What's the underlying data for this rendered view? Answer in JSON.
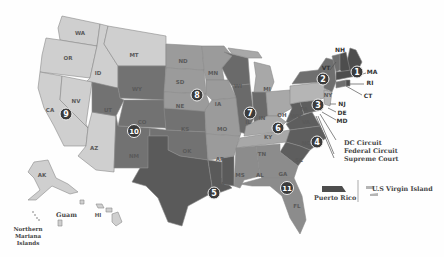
{
  "map": {
    "title": "U.S. Federal Judicial Circuits",
    "colors": {
      "circuit_1": "#4d4d4d",
      "circuit_2": "#6f6f6f",
      "circuit_3": "#b5b5b5",
      "circuit_4": "#5e5e5e",
      "circuit_5": "#5a5a5a",
      "circuit_6": "#a8a8a8",
      "circuit_7": "#6a6a6a",
      "circuit_8": "#9b9b9b",
      "circuit_9": "#cfcfcf",
      "circuit_10": "#727272",
      "circuit_11": "#8c8c8c",
      "badge": "#3b3b3b"
    },
    "circuits": [
      {
        "number": "1",
        "states": [
          "ME",
          "NH",
          "MA",
          "RI",
          "Puerto Rico"
        ]
      },
      {
        "number": "2",
        "states": [
          "VT",
          "NY",
          "CT"
        ]
      },
      {
        "number": "3",
        "states": [
          "PA",
          "NJ",
          "DE",
          "U.S Virgin Island"
        ]
      },
      {
        "number": "4",
        "states": [
          "MD",
          "VA",
          "WV",
          "NC",
          "SC"
        ]
      },
      {
        "number": "5",
        "states": [
          "TX",
          "LA",
          "MS"
        ]
      },
      {
        "number": "6",
        "states": [
          "MI",
          "OH",
          "KY",
          "TN"
        ]
      },
      {
        "number": "7",
        "states": [
          "WI",
          "IL",
          "IN"
        ]
      },
      {
        "number": "8",
        "states": [
          "ND",
          "SD",
          "NE",
          "MN",
          "IA",
          "MO",
          "AR"
        ]
      },
      {
        "number": "9",
        "states": [
          "WA",
          "OR",
          "ID",
          "MT",
          "CA",
          "NV",
          "AZ",
          "AK",
          "HI",
          "Guam",
          "Northern Mariana Islands"
        ]
      },
      {
        "number": "10",
        "states": [
          "WY",
          "UT",
          "CO",
          "KS",
          "OK",
          "NM"
        ]
      },
      {
        "number": "11",
        "states": [
          "AL",
          "GA",
          "FL"
        ]
      }
    ],
    "state_labels": {
      "WA": "WA",
      "OR": "OR",
      "ID": "ID",
      "MT": "MT",
      "CA": "CA",
      "NV": "NV",
      "AZ": "AZ",
      "WY": "WY",
      "UT": "UT",
      "CO": "CO",
      "NM": "NM",
      "KS": "KS",
      "OK": "OK",
      "TX": "TX",
      "ND": "ND",
      "SD": "SD",
      "NE": "NE",
      "MN": "MN",
      "IA": "IA",
      "MO": "MO",
      "AR": "AR",
      "LA": "LA",
      "MS": "MS",
      "AL": "AL",
      "GA": "GA",
      "FL": "FL",
      "SC": "SC",
      "NC": "NC",
      "TN": "TN",
      "KY": "KY",
      "VA": "VA",
      "WV": "WV",
      "OH": "OH",
      "IN": "IN",
      "IL": "IL",
      "WI": "WI",
      "MI": "MI",
      "PA": "PA",
      "NY": "NY",
      "AK": "AK",
      "HI": "HI"
    },
    "callouts": {
      "VT": "VT",
      "NH": "NH",
      "MA": "MA",
      "RI": "RI",
      "CT": "CT",
      "NJ": "NJ",
      "DE": "DE",
      "MD": "MD",
      "dc_circuit": "DC Circuit",
      "federal_circuit": "Federal Circuit",
      "supreme_court": "Supreme Court"
    },
    "territories": {
      "guam": "Guam",
      "nmi_line1": "Northern",
      "nmi_line2": "Mariana",
      "nmi_line3": "Islands",
      "puerto_rico": "Puerto Rico",
      "usvi": "U.S Virgin Island"
    }
  }
}
